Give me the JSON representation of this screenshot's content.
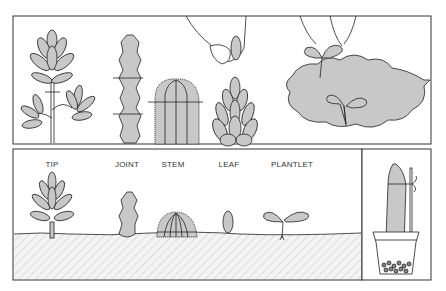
{
  "figure": {
    "topic": "Succulent propagation",
    "labels": {
      "tip": "TIP",
      "joint": "JOINT",
      "stem": "STEM",
      "leaf": "LEAF",
      "plantlet": "PLANTLET"
    },
    "colors": {
      "plant_fill": "#c8c8c8",
      "outline": "#222222",
      "soil_hatch": "#dcdcdc",
      "background": "#ffffff"
    }
  }
}
